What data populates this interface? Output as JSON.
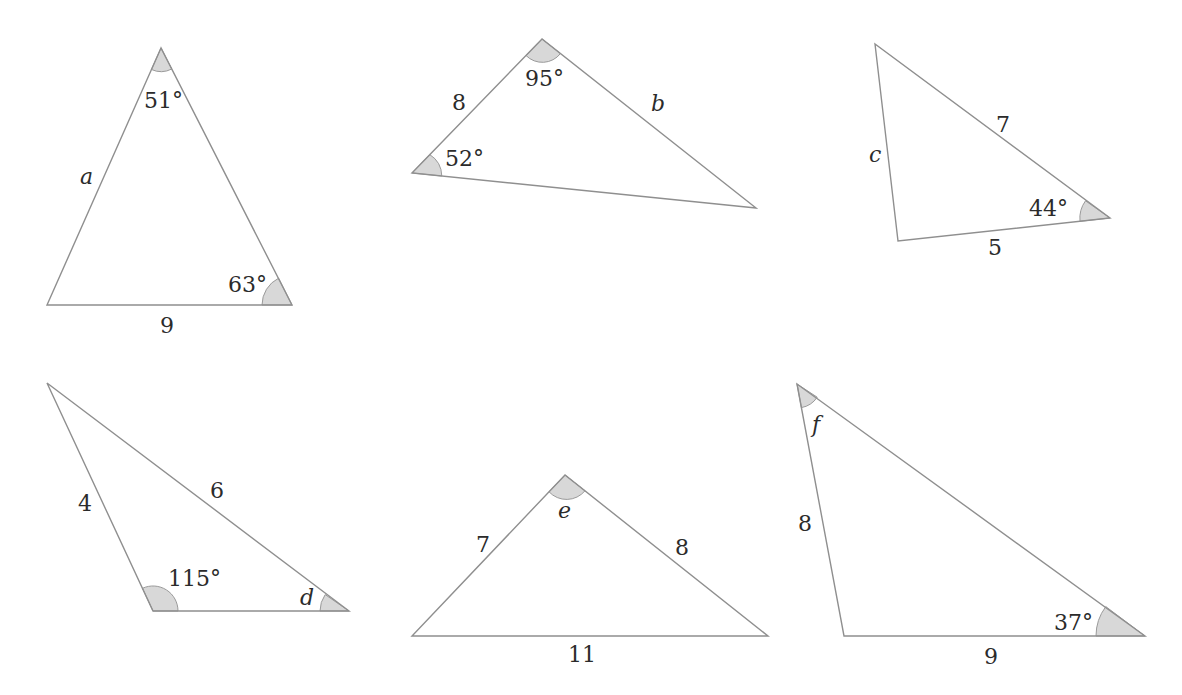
{
  "colors": {
    "background": "#ffffff",
    "edge": "#8f8f8f",
    "angle_fill": "#d8d8d8",
    "text": "#2b2b2b"
  },
  "triangles": [
    {
      "id": "triangle-1",
      "vertices": [
        [
          161,
          48
        ],
        [
          47,
          305
        ],
        [
          292,
          305
        ]
      ],
      "labels": {
        "top_angle": "51°",
        "right_angle": "63°",
        "left_side": "a",
        "bottom_side": "9"
      }
    },
    {
      "id": "triangle-2",
      "vertices": [
        [
          542,
          39
        ],
        [
          412,
          173
        ],
        [
          756,
          208
        ]
      ],
      "labels": {
        "top_angle": "95°",
        "left_angle": "52°",
        "left_side": "8",
        "right_side": "b"
      }
    },
    {
      "id": "triangle-3",
      "vertices": [
        [
          875,
          44
        ],
        [
          898,
          241
        ],
        [
          1110,
          218
        ]
      ],
      "labels": {
        "left_side": "c",
        "hypotenuse": "7",
        "right_angle": "44°",
        "bottom_side": "5"
      }
    },
    {
      "id": "triangle-4",
      "vertices": [
        [
          47,
          383
        ],
        [
          153,
          611
        ],
        [
          349,
          611
        ]
      ],
      "labels": {
        "left_side": "4",
        "top_side": "6",
        "bottom_left_angle": "115°",
        "bottom_right_angle": "d"
      }
    },
    {
      "id": "triangle-5",
      "vertices": [
        [
          565,
          475
        ],
        [
          412,
          636
        ],
        [
          768,
          636
        ]
      ],
      "labels": {
        "top_angle": "e",
        "left_side": "7",
        "right_side": "8",
        "bottom_side": "11"
      }
    },
    {
      "id": "triangle-6",
      "vertices": [
        [
          797,
          384
        ],
        [
          844,
          636
        ],
        [
          1145,
          636
        ]
      ],
      "labels": {
        "top_angle": "f",
        "left_side": "8",
        "right_angle": "37°",
        "bottom_side": "9"
      }
    }
  ]
}
